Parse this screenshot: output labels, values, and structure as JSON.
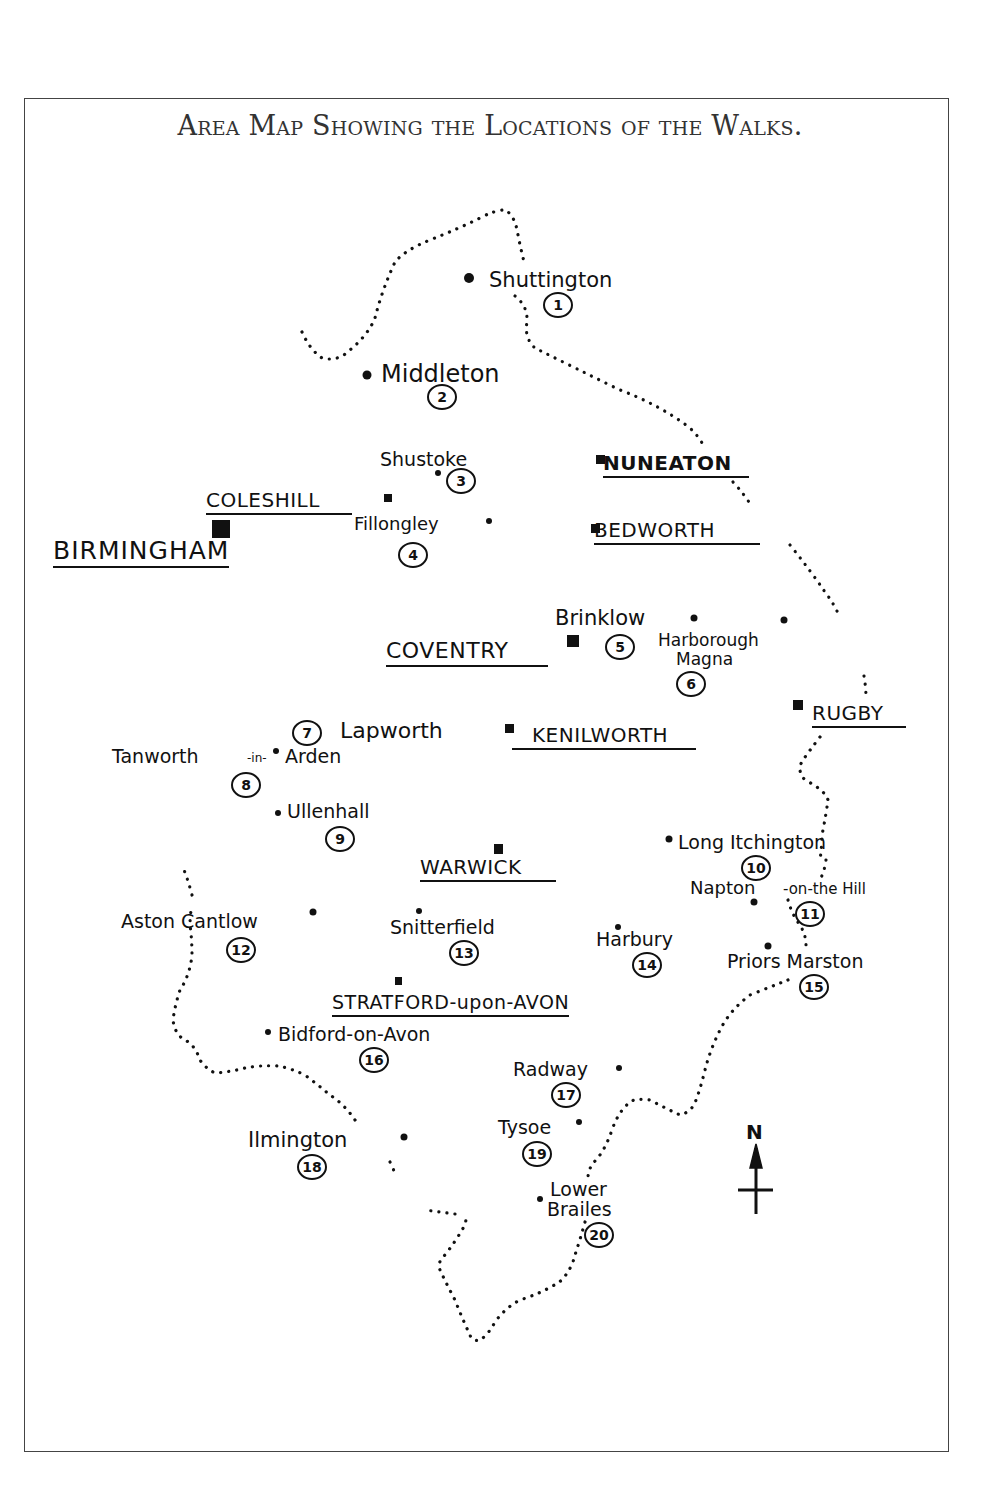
{
  "title": "Area Map Showing the Locations of the Walks.",
  "towns": [
    {
      "name": "BIRMINGHAM",
      "size": "big"
    },
    {
      "name": "COLESHILL"
    },
    {
      "name": "NUNEATON"
    },
    {
      "name": "BEDWORTH"
    },
    {
      "name": "COVENTRY"
    },
    {
      "name": "KENILWORTH"
    },
    {
      "name": "RUGBY"
    },
    {
      "name": "WARWICK"
    },
    {
      "name": "STRATFORD-upon-AVON"
    }
  ],
  "walks": [
    {
      "number": "1",
      "name": "Shuttington"
    },
    {
      "number": "2",
      "name": "Middleton"
    },
    {
      "number": "3",
      "name": "Shustoke"
    },
    {
      "number": "4",
      "name": "Fillongley"
    },
    {
      "number": "5",
      "name": "Brinklow"
    },
    {
      "number": "6",
      "name": "Harborough Magna",
      "line1": "Harborough",
      "line2": "Magna"
    },
    {
      "number": "7",
      "name": "Lapworth"
    },
    {
      "number": "8",
      "name": "Tanworth-in-Arden",
      "line1": "Tanworth",
      "line2": "-in-",
      "line3": "Arden"
    },
    {
      "number": "9",
      "name": "Ullenhall"
    },
    {
      "number": "10",
      "name": "Long Itchington"
    },
    {
      "number": "11",
      "name": "Napton-on-the Hill",
      "line1": "Napton",
      "line2": "-on-the Hill"
    },
    {
      "number": "12",
      "name": "Aston Cantlow"
    },
    {
      "number": "13",
      "name": "Snitterfield"
    },
    {
      "number": "14",
      "name": "Harbury"
    },
    {
      "number": "15",
      "name": "Priors Marston"
    },
    {
      "number": "16",
      "name": "Bidford-on-Avon"
    },
    {
      "number": "17",
      "name": "Radway"
    },
    {
      "number": "18",
      "name": "Ilmington"
    },
    {
      "number": "19",
      "name": "Tysoe"
    },
    {
      "number": "20",
      "name": "Lower Brailes",
      "line1": "Lower",
      "line2": "Brailes"
    }
  ],
  "compass": {
    "label": "N",
    "icon": "north-arrow-icon"
  },
  "colors": {
    "ink": "#111111",
    "frame": "#444444",
    "paper": "#ffffff"
  }
}
